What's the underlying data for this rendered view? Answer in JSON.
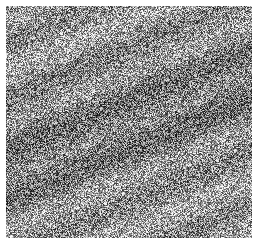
{
  "image": {
    "description": "Grayscale noise texture patch",
    "background": "#ffffff",
    "tone_dark": "#2a2a2a",
    "tone_light": "#f2f2f2"
  }
}
